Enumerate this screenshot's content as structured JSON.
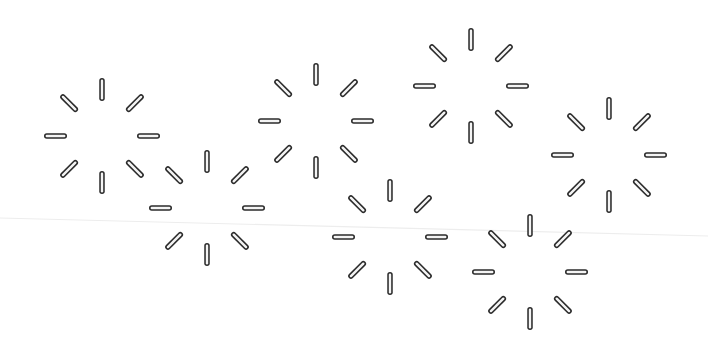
{
  "canvas": {
    "width": 708,
    "height": 350,
    "background": "#ffffff",
    "stroke_color": "#2b2b2b",
    "fill_color": "#f4f4f4"
  },
  "crease": {
    "x1": 0,
    "y1": 218,
    "x2": 708,
    "y2": 236,
    "color": "#ededed"
  },
  "sparkle_style": {
    "rays": 8,
    "inner_radius": 35,
    "outer_radius": 58,
    "stroke_width": 5.5,
    "inner_width": 2.4
  },
  "sparkles": [
    {
      "id": "sparkle-1",
      "icon": "sparkle-burst-icon",
      "cx": 102,
      "cy": 136
    },
    {
      "id": "sparkle-2",
      "icon": "sparkle-burst-icon",
      "cx": 207,
      "cy": 208
    },
    {
      "id": "sparkle-3",
      "icon": "sparkle-burst-icon",
      "cx": 316,
      "cy": 121
    },
    {
      "id": "sparkle-4",
      "icon": "sparkle-burst-icon",
      "cx": 471,
      "cy": 86
    },
    {
      "id": "sparkle-5",
      "icon": "sparkle-burst-icon",
      "cx": 609,
      "cy": 155
    },
    {
      "id": "sparkle-6",
      "icon": "sparkle-burst-icon",
      "cx": 390,
      "cy": 237
    },
    {
      "id": "sparkle-7",
      "icon": "sparkle-burst-icon",
      "cx": 530,
      "cy": 272
    }
  ]
}
